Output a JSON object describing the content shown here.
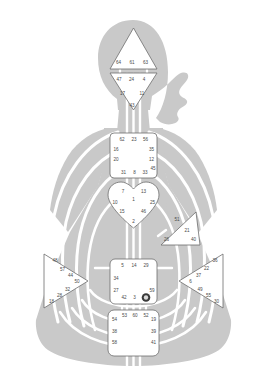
{
  "chart": {
    "type": "bodygraph",
    "body_color": "#c9c9c9",
    "center_fill": "#ffffff",
    "center_stroke": "#6d6d6d",
    "channel_color": "#ffffff",
    "gate_text_color": "#4a4a4a",
    "defined_gate_color": "#3a3a3a"
  },
  "centers": {
    "head": {
      "name": "Head",
      "shape": "triangle-up",
      "defined": false,
      "gates": [
        {
          "id": "g64",
          "label": "64",
          "x": 118.5,
          "y": 62.5,
          "defined": false
        },
        {
          "id": "g61",
          "label": "61",
          "x": 132.0,
          "y": 62.5,
          "defined": false
        },
        {
          "id": "g63",
          "label": "63",
          "x": 145.5,
          "y": 62.5,
          "defined": false
        }
      ]
    },
    "ajna": {
      "name": "Ajna",
      "shape": "triangle-down",
      "defined": false,
      "gates": [
        {
          "id": "g47",
          "label": "47",
          "x": 119.0,
          "y": 80.0,
          "defined": false
        },
        {
          "id": "g24",
          "label": "24",
          "x": 131.5,
          "y": 80.0,
          "defined": false
        },
        {
          "id": "g4",
          "label": "4",
          "x": 144.0,
          "y": 80.0,
          "defined": false
        },
        {
          "id": "g17",
          "label": "17",
          "x": 122.5,
          "y": 94.0,
          "defined": false
        },
        {
          "id": "g11",
          "label": "11",
          "x": 142.0,
          "y": 94.0,
          "defined": false
        },
        {
          "id": "g43",
          "label": "43",
          "x": 132.0,
          "y": 105.5,
          "defined": false
        }
      ]
    },
    "throat": {
      "name": "Throat",
      "shape": "square",
      "defined": false,
      "gates": [
        {
          "id": "g62",
          "label": "62",
          "x": 122.0,
          "y": 139.5,
          "defined": false
        },
        {
          "id": "g23",
          "label": "23",
          "x": 134.0,
          "y": 139.5,
          "defined": false
        },
        {
          "id": "g56",
          "label": "56",
          "x": 145.5,
          "y": 139.5,
          "defined": false
        },
        {
          "id": "g16",
          "label": "16",
          "x": 116.0,
          "y": 149.5,
          "defined": false
        },
        {
          "id": "g35",
          "label": "35",
          "x": 151.5,
          "y": 149.5,
          "defined": false
        },
        {
          "id": "g20",
          "label": "20",
          "x": 116.0,
          "y": 160.0,
          "defined": false
        },
        {
          "id": "g12",
          "label": "12",
          "x": 151.5,
          "y": 160.0,
          "defined": false
        },
        {
          "id": "g45",
          "label": "45",
          "x": 153.0,
          "y": 168.5,
          "defined": false
        },
        {
          "id": "g31",
          "label": "31",
          "x": 123.5,
          "y": 172.5,
          "defined": false
        },
        {
          "id": "g8",
          "label": "8",
          "x": 134.5,
          "y": 172.5,
          "defined": false
        },
        {
          "id": "g33",
          "label": "33",
          "x": 145.0,
          "y": 172.5,
          "defined": false
        }
      ]
    },
    "g_center": {
      "name": "G Center",
      "shape": "heart",
      "defined": false,
      "gates": [
        {
          "id": "g7",
          "label": "7",
          "x": 123.0,
          "y": 192.0,
          "defined": false
        },
        {
          "id": "g13",
          "label": "13",
          "x": 143.5,
          "y": 192.0,
          "defined": false
        },
        {
          "id": "g1",
          "label": "1",
          "x": 133.5,
          "y": 199.5,
          "defined": false
        },
        {
          "id": "g10",
          "label": "10",
          "x": 115.0,
          "y": 202.5,
          "defined": false
        },
        {
          "id": "g25",
          "label": "25",
          "x": 152.5,
          "y": 202.5,
          "defined": false
        },
        {
          "id": "g15",
          "label": "15",
          "x": 122.0,
          "y": 211.5,
          "defined": false
        },
        {
          "id": "g46",
          "label": "46",
          "x": 143.5,
          "y": 211.5,
          "defined": false
        },
        {
          "id": "g2",
          "label": "2",
          "x": 133.5,
          "y": 221.5,
          "defined": false
        }
      ]
    },
    "heart": {
      "name": "Heart / Ego",
      "shape": "triangle-left",
      "defined": false,
      "gates": [
        {
          "id": "g51",
          "label": "51",
          "x": 177.0,
          "y": 220.0,
          "defined": false
        },
        {
          "id": "g21",
          "label": "21",
          "x": 187.0,
          "y": 230.5,
          "defined": false
        },
        {
          "id": "g26",
          "label": "26",
          "x": 166.5,
          "y": 239.5,
          "defined": false
        },
        {
          "id": "g40",
          "label": "40",
          "x": 193.5,
          "y": 239.5,
          "defined": false
        }
      ]
    },
    "spleen": {
      "name": "Spleen",
      "shape": "triangle-right",
      "defined": false,
      "gates": [
        {
          "id": "g48",
          "label": "48",
          "x": 55.0,
          "y": 261.0,
          "defined": false
        },
        {
          "id": "g57",
          "label": "57",
          "x": 62.5,
          "y": 269.5,
          "defined": false
        },
        {
          "id": "g44",
          "label": "44",
          "x": 70.5,
          "y": 276.0,
          "defined": false
        },
        {
          "id": "g50",
          "label": "50",
          "x": 77.0,
          "y": 282.0,
          "defined": false
        },
        {
          "id": "g32",
          "label": "32",
          "x": 67.5,
          "y": 289.5,
          "defined": false
        },
        {
          "id": "g28",
          "label": "28",
          "x": 59.5,
          "y": 295.5,
          "defined": false
        },
        {
          "id": "g18",
          "label": "18",
          "x": 51.5,
          "y": 301.5,
          "defined": false
        }
      ]
    },
    "solar_plexus": {
      "name": "Solar Plexus",
      "shape": "triangle-left",
      "defined": false,
      "gates": [
        {
          "id": "g36",
          "label": "36",
          "x": 215.0,
          "y": 261.0,
          "defined": false
        },
        {
          "id": "g22",
          "label": "22",
          "x": 206.5,
          "y": 268.5,
          "defined": false
        },
        {
          "id": "g37",
          "label": "37",
          "x": 198.5,
          "y": 275.5,
          "defined": false
        },
        {
          "id": "g6",
          "label": "6",
          "x": 190.5,
          "y": 281.5,
          "defined": false
        },
        {
          "id": "g49",
          "label": "49",
          "x": 200.0,
          "y": 289.5,
          "defined": false
        },
        {
          "id": "g55",
          "label": "55",
          "x": 208.5,
          "y": 295.5,
          "defined": false
        },
        {
          "id": "g30",
          "label": "30",
          "x": 216.5,
          "y": 301.5,
          "defined": false
        }
      ]
    },
    "sacral": {
      "name": "Sacral",
      "shape": "square",
      "defined": false,
      "gates": [
        {
          "id": "g5",
          "label": "5",
          "x": 122.5,
          "y": 266.0,
          "defined": false
        },
        {
          "id": "g14",
          "label": "14",
          "x": 134.0,
          "y": 266.0,
          "defined": false
        },
        {
          "id": "g29",
          "label": "29",
          "x": 146.0,
          "y": 266.0,
          "defined": false
        },
        {
          "id": "g34",
          "label": "34",
          "x": 116.0,
          "y": 279.0,
          "defined": false
        },
        {
          "id": "g27",
          "label": "27",
          "x": 116.0,
          "y": 290.5,
          "defined": false
        },
        {
          "id": "g59",
          "label": "59",
          "x": 152.0,
          "y": 290.5,
          "defined": false
        },
        {
          "id": "g42",
          "label": "42",
          "x": 124.0,
          "y": 297.5,
          "defined": false
        },
        {
          "id": "g3",
          "label": "3",
          "x": 134.5,
          "y": 297.5,
          "defined": false
        },
        {
          "id": "g9",
          "label": "9",
          "x": 146.0,
          "y": 297.5,
          "defined": true
        }
      ]
    },
    "root": {
      "name": "Root",
      "shape": "square",
      "defined": false,
      "gates": [
        {
          "id": "g53",
          "label": "53",
          "x": 124.5,
          "y": 316.0,
          "defined": false
        },
        {
          "id": "g60",
          "label": "60",
          "x": 135.0,
          "y": 316.0,
          "defined": false
        },
        {
          "id": "g52",
          "label": "52",
          "x": 146.0,
          "y": 316.0,
          "defined": false
        },
        {
          "id": "g54",
          "label": "54",
          "x": 114.5,
          "y": 320.0,
          "defined": false
        },
        {
          "id": "g19",
          "label": "19",
          "x": 153.5,
          "y": 320.0,
          "defined": false
        },
        {
          "id": "g38",
          "label": "38",
          "x": 114.5,
          "y": 331.5,
          "defined": false
        },
        {
          "id": "g39",
          "label": "39",
          "x": 153.5,
          "y": 331.5,
          "defined": false
        },
        {
          "id": "g58",
          "label": "58",
          "x": 114.5,
          "y": 342.5,
          "defined": false
        },
        {
          "id": "g41",
          "label": "41",
          "x": 153.5,
          "y": 342.5,
          "defined": false
        }
      ]
    }
  }
}
